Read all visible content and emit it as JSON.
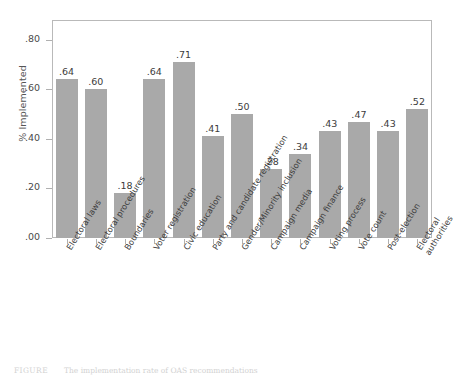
{
  "chart_data": {
    "type": "bar",
    "title": "",
    "xlabel": "",
    "ylabel": "% Implemented",
    "ylim": [
      0.0,
      0.88
    ],
    "ytick_values": [
      0.0,
      0.2,
      0.4,
      0.6,
      0.8
    ],
    "ytick_labels": [
      ".00",
      ".20",
      ".40",
      ".60",
      ".80"
    ],
    "grid": false,
    "legend": "none",
    "bar_color": "#a9a9a9",
    "categories": [
      "Electoral laws",
      "Electoral procedures",
      "Boundaries",
      "Voter registration",
      "Civic education",
      "Party and candidate registration",
      "Gender/Minority inclusion",
      "Campaign media",
      "Campaign finance",
      "Voting process",
      "Vote count",
      "Post-election",
      "Electoral authorities"
    ],
    "values": [
      0.64,
      0.6,
      0.18,
      0.64,
      0.71,
      0.41,
      0.5,
      0.28,
      0.34,
      0.43,
      0.47,
      0.43,
      0.52
    ],
    "value_labels": [
      ".64",
      ".60",
      ".18",
      ".64",
      ".71",
      ".41",
      ".50",
      ".28",
      ".34",
      ".43",
      ".47",
      ".43",
      ".52"
    ]
  },
  "caption": {
    "tag": "FIGURE",
    "text": "The implementation rate of OAS recommendations"
  }
}
